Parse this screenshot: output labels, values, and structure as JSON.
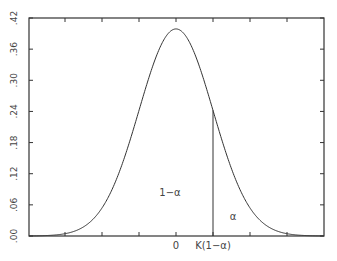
{
  "chart_data": {
    "type": "line",
    "title": "",
    "xlabel": "",
    "ylabel": "",
    "ylim": [
      0,
      0.42
    ],
    "xlim": [
      -4,
      4
    ],
    "y_ticks": [
      ".00",
      ".06",
      ".12",
      ".18",
      ".24",
      ".30",
      ".36",
      ".42"
    ],
    "y_tick_values": [
      0,
      0.06,
      0.12,
      0.18,
      0.24,
      0.3,
      0.36,
      0.42
    ],
    "x_tick_positions": [
      -3,
      -2,
      -1,
      0,
      1,
      2,
      3
    ],
    "x_tick_labels": [
      {
        "x": 0,
        "label": "0"
      },
      {
        "x": 1,
        "label": "K(1−α)"
      }
    ],
    "series": [
      {
        "name": "normal density",
        "x": [
          -4,
          -3,
          -2.5,
          -2,
          -1.5,
          -1,
          -0.5,
          0,
          0.5,
          1,
          1.5,
          2,
          2.5,
          3,
          4
        ],
        "values": [
          0.0001,
          0.0044,
          0.0175,
          0.054,
          0.1295,
          0.242,
          0.3521,
          0.3989,
          0.3521,
          0.242,
          0.1295,
          0.054,
          0.0175,
          0.0044,
          0.0001
        ]
      }
    ],
    "critical_line": {
      "x": 1,
      "y_top": 0.242
    },
    "annotations": [
      {
        "text": "1−α",
        "region": "left of critical value"
      },
      {
        "text": "α",
        "region": "right tail"
      }
    ],
    "grid": false,
    "legend": "none"
  }
}
